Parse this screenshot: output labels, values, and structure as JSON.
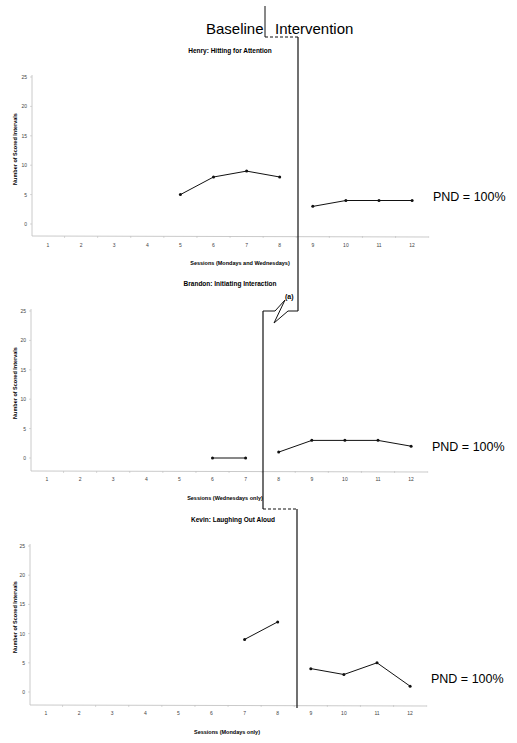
{
  "header": {
    "baseline_label": "Baseline",
    "intervention_label": "Intervention"
  },
  "chart_data": [
    {
      "type": "line",
      "title": "Henry: Hitting for Attention",
      "xlabel": "Sessions (Mondays and Wednesdays)",
      "ylabel": "Number of Scored Intervals",
      "ylim": [
        0,
        25
      ],
      "yticks": [
        0,
        5,
        10,
        15,
        20,
        25
      ],
      "x_tick_labels": [
        "1",
        "2",
        "3",
        "4",
        "5",
        "6",
        "7",
        "8",
        "9",
        "10",
        "11",
        "12"
      ],
      "grid": false,
      "phase_change_after_session": 8,
      "series": [
        {
          "name": "Baseline",
          "x": [
            5,
            6,
            7,
            8
          ],
          "values": [
            5,
            8,
            9,
            8
          ]
        },
        {
          "name": "Intervention",
          "x": [
            9,
            10,
            11,
            12
          ],
          "values": [
            3,
            4,
            4,
            4
          ]
        }
      ],
      "annotation": "PND = 100%"
    },
    {
      "type": "line",
      "title": "Brandon: Initiating Interaction",
      "xlabel": "Sessions (Wednesdays only)",
      "ylabel": "Number of Scored Intervals",
      "ylim": [
        0,
        25
      ],
      "yticks": [
        0,
        5,
        10,
        15,
        20,
        25
      ],
      "x_tick_labels": [
        "1",
        "2",
        "3",
        "4",
        "5",
        "6",
        "7",
        "8",
        "9",
        "10",
        "11",
        "12"
      ],
      "grid": false,
      "phase_change_after_session": 7,
      "break_note": "(a)",
      "series": [
        {
          "name": "Baseline",
          "x": [
            6,
            7
          ],
          "values": [
            0,
            0
          ]
        },
        {
          "name": "Intervention",
          "x": [
            8,
            9,
            10,
            11,
            12
          ],
          "values": [
            1,
            3,
            3,
            3,
            2
          ]
        }
      ],
      "annotation": "PND = 100%"
    },
    {
      "type": "line",
      "title": "Kevin: Laughing Out Aloud",
      "xlabel": "Sessions (Mondays only)",
      "ylabel": "Number of Scored Intervals",
      "ylim": [
        0,
        25
      ],
      "yticks": [
        0,
        5,
        10,
        15,
        20,
        25
      ],
      "x_tick_labels": [
        "1",
        "2",
        "3",
        "4",
        "5",
        "6",
        "7",
        "8",
        "9",
        "10",
        "11",
        "12"
      ],
      "grid": false,
      "phase_change_after_session": 8,
      "series": [
        {
          "name": "Baseline",
          "x": [
            7,
            8
          ],
          "values": [
            9,
            12
          ]
        },
        {
          "name": "Intervention",
          "x": [
            9,
            10,
            11,
            12
          ],
          "values": [
            4,
            3,
            5,
            1
          ]
        }
      ],
      "annotation": "PND = 100%"
    }
  ]
}
